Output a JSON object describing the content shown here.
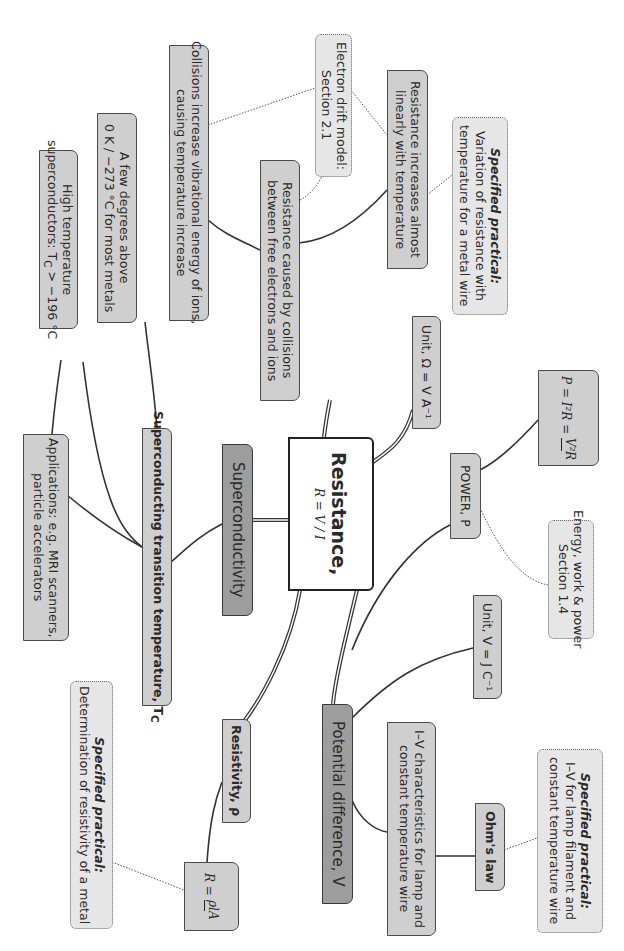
{
  "center": {
    "title": "Resistance,",
    "formula": "R = V / I"
  },
  "branches": {
    "superconductivity": {
      "label": "Superconductivity",
      "transition": {
        "label": "Superconducting transition temperature, T",
        "subscript": "C"
      },
      "few_degrees": {
        "line1": "A few degrees above",
        "line2": "0 K / −273 °C for most metals"
      },
      "high_temp": {
        "line1": "High temperature",
        "line2": "superconductors: T",
        "subscript": "C",
        "line2_end": " > −196 °C"
      },
      "applications": {
        "line1": "Applications: e.g. MRI scanners,",
        "line2": "particle accelerators"
      }
    },
    "resistance_cause": {
      "label_line1": "Resistance caused by collisions",
      "label_line2": "between free electrons and ions",
      "collisions": {
        "line1": "Collisions increase vibrational energy of ions,",
        "line2": "causing temperature increase"
      },
      "increases": {
        "line1": "Resistance increases almost",
        "line2": "linearly with temperature"
      },
      "electron_drift": {
        "line1": "Electron drift model:",
        "line2": "Section 2.1"
      },
      "practical": {
        "title": "Specified practical:",
        "line1": "Variation of resistance with",
        "line2": "temperature for a metal wire"
      }
    },
    "unit_ohm": {
      "label": "Unit, Ω = V A⁻¹"
    },
    "power": {
      "label": "POWER, P",
      "formula": {
        "lhs": "P = I²R = ",
        "num": "V²",
        "den": "R"
      },
      "energy": {
        "line1": "Energy, work & power",
        "line2": "Section 1.4"
      }
    },
    "potential_difference": {
      "label": "Potential difference, V",
      "unit": {
        "label": "Unit, V = J C⁻¹"
      },
      "iv": {
        "line1": "I–V characteristics for lamp and",
        "line2": "constant temperature wire"
      },
      "ohms_law": {
        "label": "Ohm's law"
      },
      "practical": {
        "title": "Specified practical:",
        "line1": "I–V for lamp filament and",
        "line2": "constant temperature wire"
      }
    },
    "resistivity": {
      "label": "Resistivity, ρ",
      "formula": {
        "lhs": "R = ",
        "num": "ρl",
        "den": "A"
      },
      "practical": {
        "title": "Specified practical:",
        "line1": "Determination of resistivity of a metal"
      }
    }
  },
  "colors": {
    "node_fill": "#cfcfcf",
    "ref_fill": "#e6e6e6",
    "dark_fill": "#9d9d9d",
    "line": "#333333"
  }
}
